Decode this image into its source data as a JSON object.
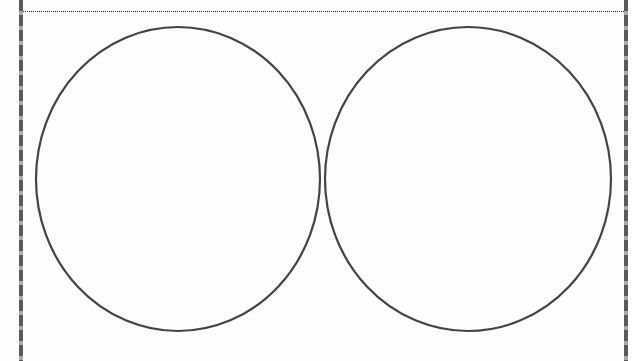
{
  "diagram": {
    "type": "blank-venn-two-circles",
    "circle_count": 2,
    "colors": {
      "stroke": "#444444",
      "background": "#fdfdfd",
      "border_dark": "#5a5a5a",
      "border_light": "#a9a9a9"
    },
    "circles": [
      {
        "id": "left",
        "cx": 178,
        "cy": 179,
        "rx": 142,
        "ry": 152
      },
      {
        "id": "right",
        "cx": 468,
        "cy": 179,
        "rx": 143,
        "ry": 152
      }
    ]
  }
}
